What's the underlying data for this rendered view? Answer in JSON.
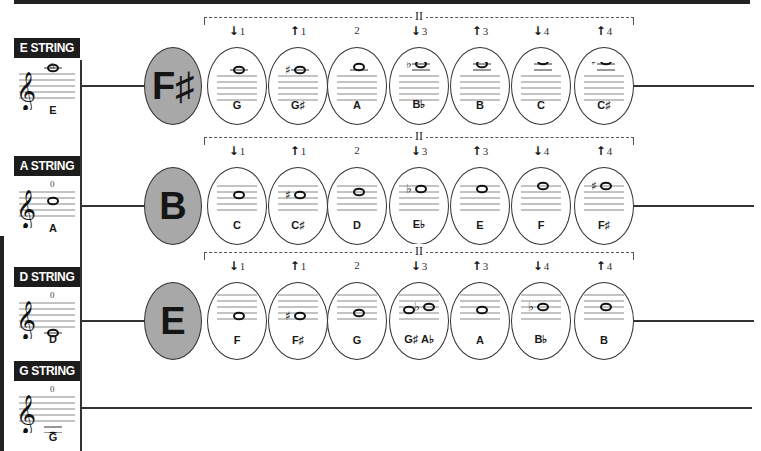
{
  "colors": {
    "dark": "#1c1c1c",
    "gray_oval": "#a8a8a8",
    "line": "#333333"
  },
  "bracket_label": "II",
  "strings": [
    {
      "label": "E STRING",
      "open_note": "E",
      "open_finger": "0",
      "y_label": 38,
      "center_y": 86,
      "start_note": "F♯",
      "notes": [
        {
          "finger": "1",
          "dir": "down",
          "name": "G",
          "acc": "",
          "pos": -1
        },
        {
          "finger": "1",
          "dir": "up",
          "name": "G♯",
          "acc": "sharp",
          "pos": -1
        },
        {
          "finger": "2",
          "dir": "",
          "name": "A",
          "acc": "",
          "pos": -1.5
        },
        {
          "finger": "3",
          "dir": "down",
          "name": "B♭",
          "acc": "flat",
          "pos": -2
        },
        {
          "finger": "3",
          "dir": "up",
          "name": "B",
          "acc": "",
          "pos": -2
        },
        {
          "finger": "4",
          "dir": "down",
          "name": "C",
          "acc": "",
          "pos": -2.5
        },
        {
          "finger": "4",
          "dir": "up",
          "name": "C♯",
          "acc": "sharp",
          "pos": -2.5
        }
      ]
    },
    {
      "label": "A STRING",
      "open_note": "A",
      "open_finger": "0",
      "y_label": 156,
      "center_y": 206,
      "start_note": "B",
      "notes": [
        {
          "finger": "1",
          "dir": "down",
          "name": "C",
          "acc": "",
          "pos": 1.5
        },
        {
          "finger": "1",
          "dir": "up",
          "name": "C♯",
          "acc": "sharp",
          "pos": 1.5
        },
        {
          "finger": "2",
          "dir": "",
          "name": "D",
          "acc": "",
          "pos": 1
        },
        {
          "finger": "3",
          "dir": "down",
          "name": "E♭",
          "acc": "flat",
          "pos": 0.5
        },
        {
          "finger": "3",
          "dir": "up",
          "name": "E",
          "acc": "",
          "pos": 0.5
        },
        {
          "finger": "4",
          "dir": "down",
          "name": "F",
          "acc": "",
          "pos": 0
        },
        {
          "finger": "4",
          "dir": "up",
          "name": "F♯",
          "acc": "sharp",
          "pos": 0
        }
      ]
    },
    {
      "label": "D STRING",
      "open_note": "D",
      "open_finger": "0",
      "y_label": 267,
      "center_y": 321,
      "start_note": "E",
      "notes": [
        {
          "finger": "1",
          "dir": "down",
          "name": "F",
          "acc": "",
          "pos": 3.5
        },
        {
          "finger": "1",
          "dir": "up",
          "name": "F♯",
          "acc": "sharp",
          "pos": 3.5
        },
        {
          "finger": "2",
          "dir": "",
          "name": "G",
          "acc": "",
          "pos": 3
        },
        {
          "finger": "3",
          "dir": "down",
          "name": "G♯ A♭",
          "acc": "both",
          "pos": 2.5
        },
        {
          "finger": "3",
          "dir": "up",
          "name": "A",
          "acc": "",
          "pos": 2.5
        },
        {
          "finger": "4",
          "dir": "down",
          "name": "B♭",
          "acc": "flat",
          "pos": 2
        },
        {
          "finger": "4",
          "dir": "up",
          "name": "B",
          "acc": "",
          "pos": 2
        }
      ]
    },
    {
      "label": "G STRING",
      "open_note": "G",
      "open_finger": "0",
      "y_label": 361,
      "center_y": 408,
      "start_note": "",
      "notes": []
    }
  ]
}
